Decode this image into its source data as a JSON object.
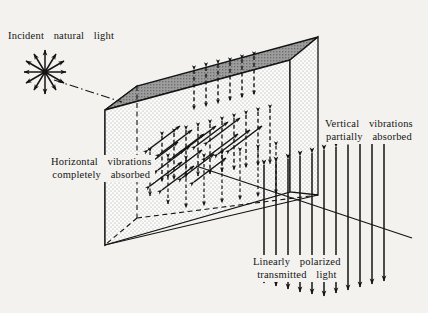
{
  "figure": {
    "background_color": "#f3f2ef",
    "ink_color": "#141414",
    "top_face_color": "#9a9a9a",
    "left_face_color": "#c9c9c9",
    "front_face_color": "#f7f7f5"
  },
  "labels": {
    "incident": "Incident  natural  light",
    "horizontal_absorbed": "Horizontal  vibrations\ncompletely  absorbed",
    "vertical_absorbed": "Vertical  vibrations\npartially  absorbed",
    "transmitted": "Linearly  polarized\ntransmitted  light"
  },
  "geometry": {
    "slab": {
      "top_front_left": [
        105,
        110
      ],
      "top_back_left": [
        137,
        86
      ],
      "top_back_right": [
        318,
        37
      ],
      "top_front_right": [
        290,
        60
      ],
      "bottom_front_left": [
        105,
        245
      ],
      "bottom_front_right": [
        290,
        192
      ],
      "bottom_back_right": [
        318,
        195
      ],
      "hidden_bottom_back_left": [
        137,
        218
      ]
    },
    "incident_ray": {
      "start": [
        52,
        79
      ],
      "end": [
        120,
        101
      ],
      "style": "dash-dot"
    },
    "exit_ray": {
      "start": [
        200,
        167
      ],
      "end": [
        410,
        237
      ],
      "style": "solid"
    },
    "starburst": {
      "center": [
        45,
        72
      ],
      "ray_count": 12,
      "radius": 21,
      "arrow_type": "double-headed"
    }
  },
  "arrow_fields": {
    "entry_face": {
      "description": "dashed vertical double-headed arrows (vertical vibrations entering)",
      "style": "dashed",
      "orientation": "vertical",
      "count": 6
    },
    "interior_horizontal": {
      "description": "solid depth-direction arrows (horizontal vibrations, being absorbed)",
      "style": "solid",
      "orientation": "depth",
      "count": 16
    },
    "interior_vertical": {
      "description": "dashed vertical double-headed arrows inside slab",
      "style": "dashed",
      "orientation": "vertical",
      "count": 20
    },
    "exit_face": {
      "description": "solid vertical double-headed arrows (linearly polarized output)",
      "style": "solid",
      "orientation": "vertical",
      "count": 11
    }
  }
}
